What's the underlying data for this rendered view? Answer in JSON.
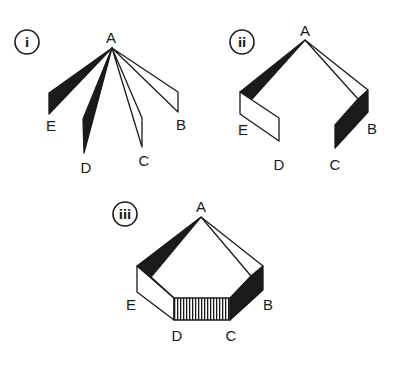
{
  "diagram": {
    "type": "folding net of a pentagonal pyramid (three stages)",
    "colors": {
      "ink": "#1a1a1a",
      "paper": "#ffffff",
      "dark_face": "#1a1a1a"
    },
    "panels": [
      {
        "id": "i",
        "numeral": "i",
        "apex_label": "A",
        "vertex_labels": {
          "E": "E",
          "D": "D",
          "C": "C",
          "B": "B"
        }
      },
      {
        "id": "ii",
        "numeral": "ii",
        "apex_label": "A",
        "vertex_labels": {
          "E": "E",
          "D": "D",
          "C": "C",
          "B": "B"
        }
      },
      {
        "id": "iii",
        "numeral": "iii",
        "apex_label": "A",
        "vertex_labels": {
          "E": "E",
          "D": "D",
          "C": "C",
          "B": "B"
        }
      }
    ]
  }
}
